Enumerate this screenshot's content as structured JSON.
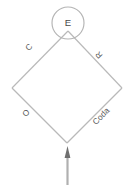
{
  "diagram": {
    "type": "rhombus-constituent-diagram",
    "background_color": "#ffffff",
    "line_color": "#b9b9b9",
    "text_color": "#5a5a5a",
    "arrow_color": "#6f6f6f",
    "top_node": {
      "label": "E",
      "shape": "circle"
    },
    "edges": [
      {
        "id": "upper-left",
        "label": "C"
      },
      {
        "id": "upper-right",
        "label": "R"
      },
      {
        "id": "lower-left",
        "label": "O"
      },
      {
        "id": "lower-right",
        "label": "Coda"
      }
    ],
    "arrow": {
      "direction": "up",
      "name": "input-arrow"
    }
  }
}
